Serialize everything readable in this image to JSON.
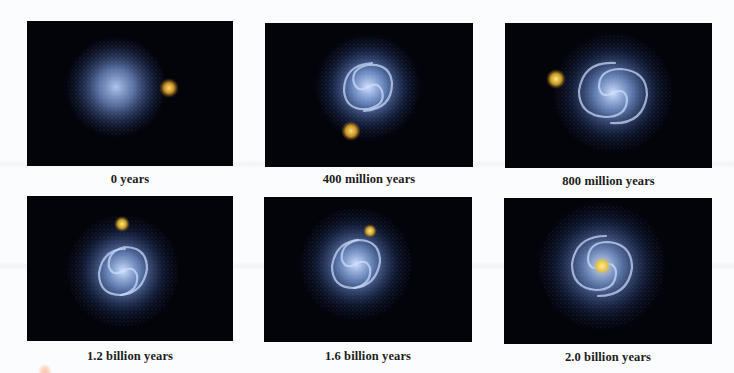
{
  "figure": {
    "panels": [
      {
        "id": "p1",
        "caption": "0 years",
        "stage": "initial",
        "galaxy_shape": "diffuse-sphere",
        "companion": "separate-right"
      },
      {
        "id": "p2",
        "caption": "400 million years",
        "stage": "first-approach",
        "galaxy_shape": "spiral",
        "companion": "below-left"
      },
      {
        "id": "p3",
        "caption": "800 million years",
        "stage": "orbit",
        "galaxy_shape": "spiral",
        "companion": "upper-left"
      },
      {
        "id": "p4",
        "caption": "1.2 billion years",
        "stage": "return",
        "galaxy_shape": "spiral",
        "companion": "above"
      },
      {
        "id": "p5",
        "caption": "1.6 billion years",
        "stage": "close-passage",
        "galaxy_shape": "spiral",
        "companion": "upper-right-close"
      },
      {
        "id": "p6",
        "caption": "2.0 billion years",
        "stage": "merged",
        "galaxy_shape": "spiral",
        "companion": "merged-at-center"
      }
    ],
    "colors": {
      "background": "#fbfcfd",
      "panel": "#03040a",
      "galaxy": "#8fb2f0",
      "companion": "#f2c23a",
      "caption": "#1c1c1c"
    }
  }
}
